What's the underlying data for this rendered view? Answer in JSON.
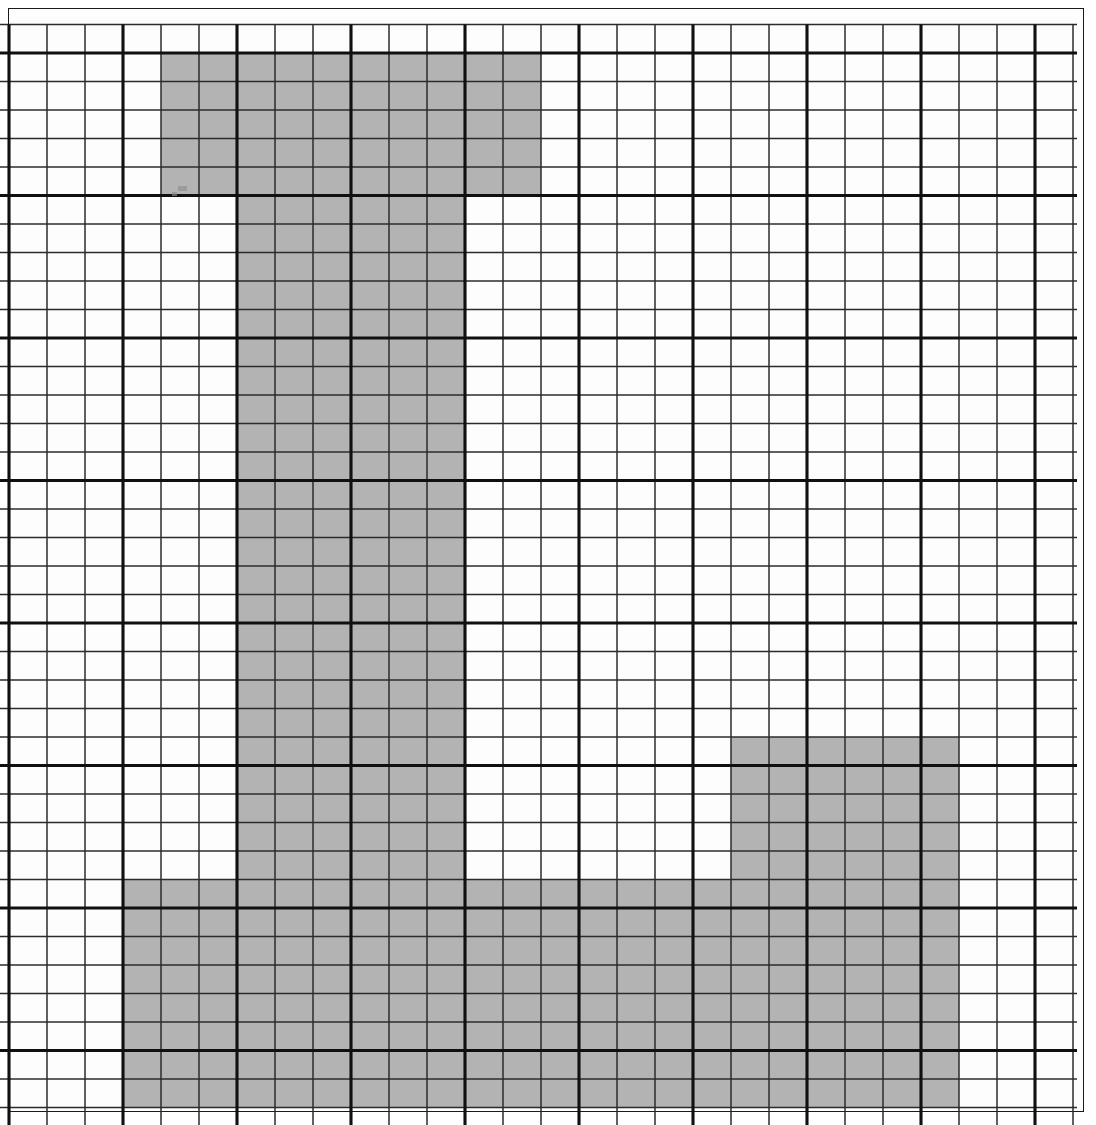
{
  "figure": {
    "title": "Shaded polyomino region on a ruled grid",
    "background_color": "#ffffff",
    "paper_color": "#fdfdfd",
    "shade_color": "#b3b3b3",
    "thin_line_color": "#2b2b2b",
    "thick_line_color": "#101010",
    "frame_color": "#1a1a1a"
  },
  "frame": {
    "left": 8,
    "top": 8,
    "width": 1076,
    "height": 1104,
    "stroke_width": 1.6,
    "label": "outer page border"
  },
  "grid": {
    "origin_x": 9,
    "origin_y": 24.5,
    "cell_width": 38,
    "cell_height": 28.5,
    "columns": 28,
    "rows": 38,
    "thick_column_every": 3,
    "thick_column_offset": 0,
    "thick_row_every": 5,
    "thick_row_offset": 1,
    "thin_stroke_width": 1.5,
    "thick_stroke_width": 3.1
  },
  "chart_data": {
    "type": "heatmap",
    "title": "Shaded polyomino region on a ruled grid",
    "xlabel": "",
    "ylabel": "",
    "grid": true,
    "legend": "none",
    "columns": 28,
    "rows": 38,
    "cell_width_px": 38,
    "cell_height_px": 28.5,
    "values": [
      "shaded",
      "unshaded"
    ],
    "shaded_color": "#b3b3b3",
    "unshaded_color": "#fdfdfd",
    "blocks": [
      {
        "name": "top-block",
        "col_start": 4,
        "col_end": 13,
        "row_start": 1,
        "row_end": 5,
        "cols": 10,
        "rows": 5,
        "cells": 50
      },
      {
        "name": "vertical-stem",
        "col_start": 6,
        "col_end": 11,
        "row_start": 6,
        "row_end": 30,
        "cols": 6,
        "rows": 25,
        "cells": 150
      },
      {
        "name": "right-block",
        "col_start": 19,
        "col_end": 24,
        "row_start": 25,
        "row_end": 37,
        "cols": 6,
        "rows": 13,
        "cells": 78
      },
      {
        "name": "bottom-block",
        "col_start": 3,
        "col_end": 24,
        "row_start": 30,
        "row_end": 37,
        "cols": 22,
        "rows": 8,
        "cells": 176
      }
    ],
    "total_shaded_cells": 416
  },
  "marks": {
    "specks": [
      {
        "name": "speck-upper-left",
        "x": 178,
        "y": 186,
        "w": 9,
        "h": 5
      },
      {
        "name": "speck-upper-left-2",
        "x": 172,
        "y": 192,
        "w": 5,
        "h": 4
      }
    ]
  }
}
